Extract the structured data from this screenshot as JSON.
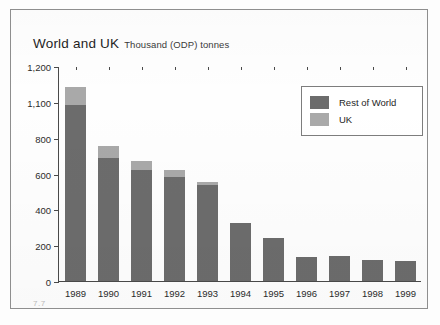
{
  "figure": {
    "number_label": "7.7",
    "frame": true
  },
  "chart_data": {
    "type": "bar",
    "title": "World and UK",
    "subtitle": "Thousand (ODP) tonnes",
    "xlabel": "",
    "ylabel": "",
    "stacked": true,
    "grid": false,
    "legend_position": "top-right",
    "categories": [
      "1989",
      "1990",
      "1991",
      "1992",
      "1993",
      "1994",
      "1995",
      "1996",
      "1997",
      "1998",
      "1999"
    ],
    "series": [
      {
        "name": "Rest of World",
        "color": "#6c6c6c",
        "values": [
          1070,
          685,
          615,
          580,
          535,
          320,
          240,
          130,
          135,
          115,
          110
        ]
      },
      {
        "name": "UK",
        "color": "#a9a9a9",
        "values": [
          70,
          65,
          55,
          35,
          15,
          0,
          0,
          0,
          0,
          0,
          0
        ]
      }
    ],
    "totals": [
      1140,
      750,
      670,
      615,
      550,
      320,
      240,
      130,
      135,
      115,
      110
    ],
    "ylim": [
      0,
      1200
    ],
    "ytick_values": [
      0,
      200,
      400,
      600,
      800,
      1100,
      1200
    ],
    "ytick_labels": [
      "0",
      "200",
      "400",
      "600",
      "800",
      "1,100",
      "1,200"
    ]
  }
}
